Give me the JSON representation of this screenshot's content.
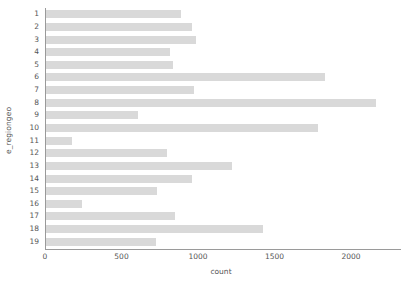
{
  "chart_data": {
    "type": "bar",
    "orientation": "horizontal",
    "title": "",
    "xlabel": "count",
    "ylabel": "e_regiongeo",
    "categories": [
      "1",
      "2",
      "3",
      "4",
      "5",
      "6",
      "7",
      "8",
      "9",
      "10",
      "11",
      "12",
      "13",
      "14",
      "15",
      "16",
      "17",
      "18",
      "19"
    ],
    "values": [
      890,
      960,
      990,
      815,
      835,
      1830,
      975,
      2160,
      610,
      1785,
      175,
      800,
      1220,
      960,
      730,
      240,
      850,
      1425,
      725
    ],
    "xlim": [
      0,
      2320
    ],
    "ylim_categories": 19,
    "x_ticks": [
      0,
      500,
      1000,
      1500,
      2000
    ],
    "x_tick_labels": [
      "0",
      "500",
      "1000",
      "1500",
      "2000"
    ],
    "grid": false,
    "legend": null,
    "bar_color": "#d9d9d9",
    "axis_color": "#9a9a9a",
    "text_color": "#555555",
    "background": "#ffffff"
  }
}
